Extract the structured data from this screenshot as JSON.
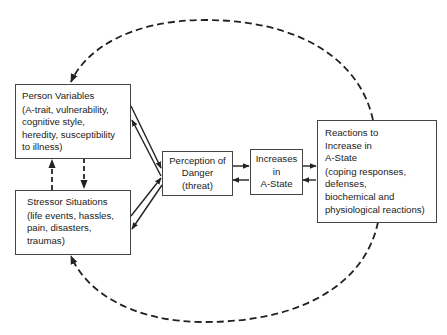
{
  "diagram": {
    "type": "flowchart",
    "nodes": {
      "person": {
        "title": "Person Variables",
        "details": [
          "(A-trait, vulnerability,",
          "cognitive style,",
          "heredity, susceptibility",
          "to illness)"
        ]
      },
      "stressor": {
        "title": "Stressor Situations",
        "details": [
          "(life events, hassles,",
          "pain, disasters,",
          "traumas)"
        ]
      },
      "perception": {
        "lines": [
          "Perception of",
          "Danger",
          "(threat)"
        ]
      },
      "increases": {
        "lines": [
          "Increases",
          "in",
          "A-State"
        ]
      },
      "reactions": {
        "title_lines": [
          "Reactions to",
          "Increase in",
          "A-State"
        ],
        "details": [
          "(coping responses,",
          "defenses,",
          "biochemical and",
          "physiological reactions)"
        ]
      }
    },
    "edges": [
      {
        "from": "person",
        "to": "perception",
        "style": "solid"
      },
      {
        "from": "perception",
        "to": "person",
        "style": "solid"
      },
      {
        "from": "stressor",
        "to": "perception",
        "style": "solid"
      },
      {
        "from": "perception",
        "to": "stressor",
        "style": "solid"
      },
      {
        "from": "perception",
        "to": "increases",
        "style": "solid"
      },
      {
        "from": "increases",
        "to": "perception",
        "style": "solid"
      },
      {
        "from": "increases",
        "to": "reactions",
        "style": "solid"
      },
      {
        "from": "reactions",
        "to": "increases",
        "style": "solid"
      },
      {
        "from": "stressor",
        "to": "person",
        "style": "dashed"
      },
      {
        "from": "person",
        "to": "stressor",
        "style": "dashed"
      },
      {
        "from": "reactions",
        "to": "person",
        "style": "dashed",
        "path": "top-arc"
      },
      {
        "from": "reactions",
        "to": "stressor",
        "style": "dashed",
        "path": "bottom-arc"
      }
    ],
    "colors": {
      "line": "#222222",
      "box_border": "#444444",
      "background": "#ffffff"
    }
  }
}
